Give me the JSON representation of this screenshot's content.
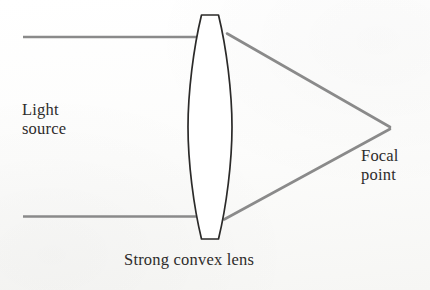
{
  "diagram": {
    "type": "optics-ray-diagram",
    "background_color": "#fbfbfa",
    "labels": {
      "light_source": "Light\nsource",
      "focal_point": "Focal\npoint",
      "lens_caption": "Strong convex lens"
    },
    "colors": {
      "ray": "#8a8a8a",
      "lens_outline": "#2b2a29",
      "lens_fill": "#ffffff",
      "text": "#2e2c2b"
    },
    "elements": {
      "lens": {
        "name": "strong convex lens",
        "shape": "biconvex",
        "center_x": 210,
        "top_y": 15,
        "bottom_y": 239,
        "half_width": 22,
        "flat_top_width": 17,
        "flat_bottom_width": 17,
        "stroke_width": 1.7
      },
      "incoming_rays": [
        {
          "name": "upper parallel ray",
          "x1": 23,
          "y1": 37,
          "x2": 196,
          "y2": 37
        },
        {
          "name": "lower parallel ray",
          "x1": 23,
          "y1": 216,
          "x2": 196,
          "y2": 216
        }
      ],
      "refracted_rays": [
        {
          "name": "upper converging ray",
          "x1": 228,
          "y1": 34,
          "x2": 389,
          "y2": 127
        },
        {
          "name": "lower converging ray",
          "x1": 225,
          "y1": 219,
          "x2": 389,
          "y2": 129
        }
      ],
      "focal_point": {
        "x": 389,
        "y": 128
      }
    },
    "ray_stroke_width": 2.6
  }
}
